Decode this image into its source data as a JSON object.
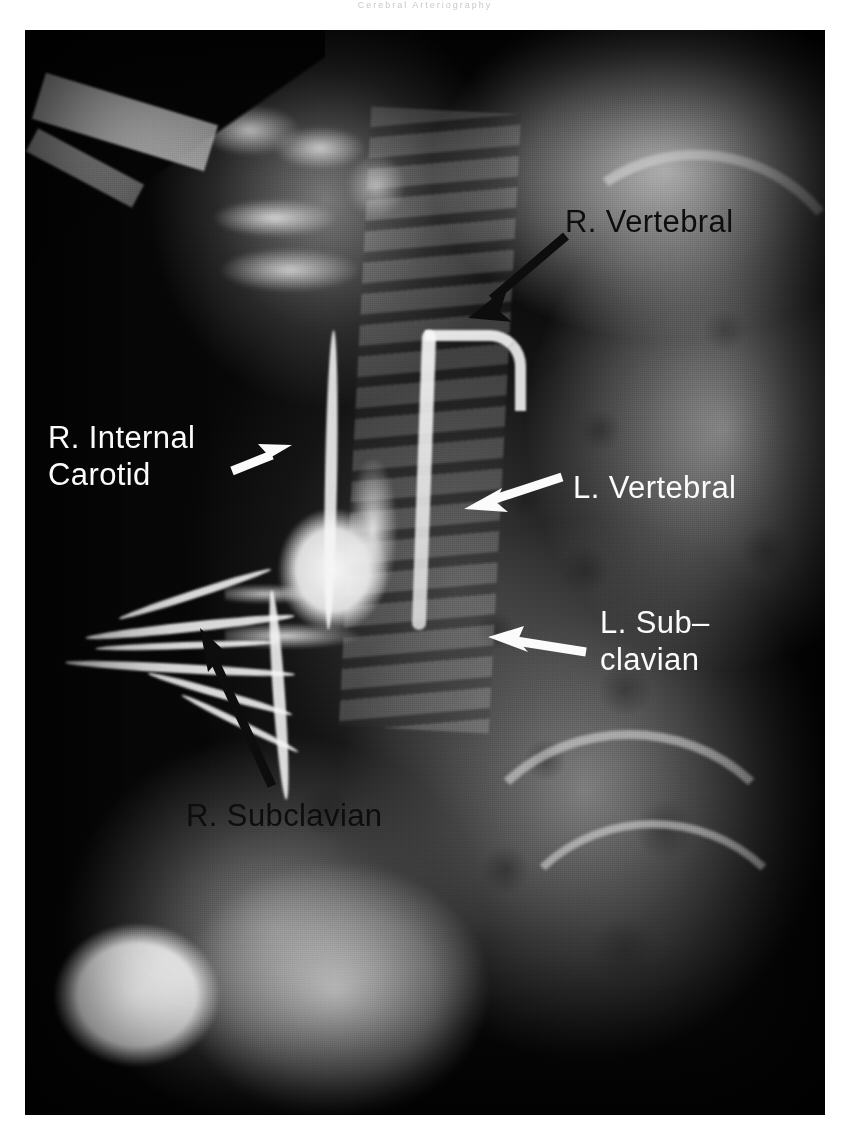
{
  "page": {
    "header_text": "Cerebral  Arteriography",
    "width": 850,
    "height": 1131
  },
  "figure": {
    "kind": "radiograph",
    "modality": "angiogram",
    "plate": {
      "background_color": "#070707",
      "left": 25,
      "top": 30,
      "width": 800,
      "height": 1085
    }
  },
  "annotations": [
    {
      "id": "r-vertebral",
      "text": "R. Vertebral",
      "color": "#0d0d0d",
      "arrow_color": "#0d0d0d",
      "arrow_from": [
        566,
        236
      ],
      "arrow_to": [
        468,
        318
      ]
    },
    {
      "id": "r-internal-carotid",
      "text": "R. Internal\nCarotid",
      "color": "#fbfbfb",
      "arrow_color": "#fbfbfb",
      "arrow_from": [
        232,
        470
      ],
      "arrow_to": [
        290,
        446
      ]
    },
    {
      "id": "l-vertebral",
      "text": "L. Vertebral",
      "color": "#fbfbfb",
      "arrow_color": "#fbfbfb",
      "arrow_from": [
        562,
        477
      ],
      "arrow_to": [
        466,
        508
      ]
    },
    {
      "id": "l-subclavian",
      "text": "L. Sub–\nclavian",
      "color": "#fbfbfb",
      "arrow_color": "#fbfbfb",
      "arrow_from": [
        586,
        650
      ],
      "arrow_to": [
        490,
        638
      ]
    },
    {
      "id": "r-subclavian",
      "text": "R. Subclavian",
      "color": "#0d0d0d",
      "arrow_color": "#0d0d0d",
      "arrow_from": [
        272,
        786
      ],
      "arrow_to": [
        200,
        629
      ]
    }
  ],
  "colors": {
    "film_black": "#070707",
    "label_dark": "#0d0d0d",
    "label_light": "#fbfbfb",
    "page_white": "#ffffff",
    "header_gray": "#c9c9cf"
  }
}
